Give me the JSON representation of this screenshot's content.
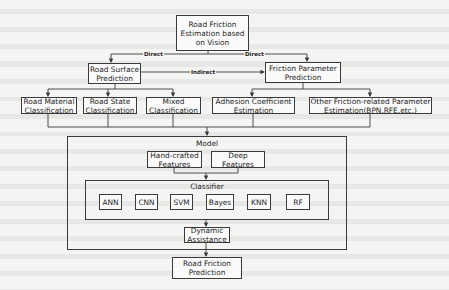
{
  "root": {
    "label": "Road Friction\nEstimation based\non Vision"
  },
  "edges": {
    "direct_left": "Direct",
    "direct_right": "Direct",
    "indirect": "Indirect"
  },
  "level1": {
    "road_surface": "Road Surface\nPrediction",
    "friction_param": "Friction Parameter\nPrediction"
  },
  "level2": {
    "road_material": "Road Material\nClassification",
    "road_state": "Road State\nClassification",
    "mixed": "Mixed\nClassification",
    "adhesion": "Adhesion Coefficient\nEstimation",
    "other": "Other Friction-related Parameter\nEstimation(BPN,RFE,etc.)"
  },
  "model": {
    "title": "Model",
    "features": [
      "Hand-crafted\nFeatures",
      "Deep\nFeatures"
    ],
    "classifier": {
      "title": "Classifier",
      "methods": [
        "ANN",
        "CNN",
        "SVM",
        "Bayes",
        "KNN",
        "RF"
      ]
    },
    "dynamic": "Dynamic\nAssistance"
  },
  "output": {
    "label": "Road Friction\nPrediction"
  },
  "colors": {
    "line": "#3a3a3a",
    "box_bg": "#fafafa",
    "page_bg": "#f4f4f2"
  }
}
